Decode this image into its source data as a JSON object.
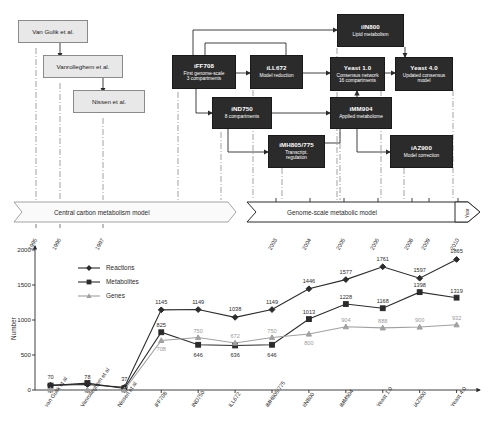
{
  "diagram": {
    "light_boxes": [
      {
        "id": "van-gulik",
        "label": "Van Gulik et al."
      },
      {
        "id": "vanrolleghem",
        "label": "Vanrolleghem et al."
      },
      {
        "id": "nissen",
        "label": "Nissen et al."
      }
    ],
    "dark_boxes": [
      {
        "id": "iff708",
        "title": "iFF708",
        "subtitle": "First genome-scale\n3 compartments"
      },
      {
        "id": "ill672",
        "title": "iLL672",
        "subtitle": "Model reduction"
      },
      {
        "id": "iin800",
        "title": "iIN800",
        "subtitle": "Lipid metabolism"
      },
      {
        "id": "yeast1",
        "title": "Yeast 1.0",
        "subtitle": "Consensus network\n16 compartments"
      },
      {
        "id": "yeast4",
        "title": "Yeast 4.0",
        "subtitle": "Updated consensus\nmodel"
      },
      {
        "id": "ind750",
        "title": "iND750",
        "subtitle": "8 compartments"
      },
      {
        "id": "imm904",
        "title": "iMM904",
        "subtitle": "Applied metabolome"
      },
      {
        "id": "imh805",
        "title": "iMH805/775",
        "subtitle": "Transcript.\nregulation"
      },
      {
        "id": "iaz900",
        "title": "iAZ900",
        "subtitle": "Model correction"
      }
    ]
  },
  "timeline": {
    "banner_left": "Central carbon metabolism model",
    "banner_right": "Genome-scale metabolic model",
    "axis_label": "Year",
    "years_left": [
      "1995",
      "1996",
      "1997"
    ],
    "years_right": [
      "2003",
      "2004",
      "2005",
      "2006",
      "2008",
      "2009",
      "2010"
    ]
  },
  "chart_data": {
    "type": "line",
    "title": "",
    "xlabel": "",
    "ylabel": "Number",
    "ylim": [
      0,
      2000
    ],
    "yticks": [
      0,
      500,
      1000,
      1500,
      2000
    ],
    "grid": false,
    "legend_position": "upper-left-inside",
    "categories": [
      "van Gulik et al",
      "Vanrolleghem et al",
      "Nissen et al",
      "iFF708",
      "iND750",
      "iLL672",
      "iMH805/775",
      "iIN800",
      "iMM904",
      "Yeast 1.0",
      "iAZ900",
      "Yeast 4.0"
    ],
    "series": [
      {
        "name": "Reactions",
        "marker": "diamond",
        "color": "#2b2b2b",
        "values": [
          70,
          78,
          37,
          1145,
          1149,
          1038,
          1149,
          1446,
          1577,
          1761,
          1597,
          1865
        ],
        "labels": [
          "70",
          "78",
          "37",
          "1145",
          "1149",
          "1038",
          "1149",
          "1446",
          "1577",
          "1761",
          "1597",
          "1865"
        ]
      },
      {
        "name": "Metabolites",
        "marker": "square",
        "color": "#2b2b2b",
        "values": [
          63,
          98,
          22,
          825,
          646,
          636,
          646,
          1013,
          1228,
          1168,
          1398,
          1319
        ],
        "labels": [
          "63",
          "98",
          "22",
          "825",
          "646",
          "636",
          "646",
          "1013",
          "1228",
          "1168",
          "1398",
          "1319"
        ]
      },
      {
        "name": "Genes",
        "marker": "triangle",
        "color": "#a0a0a0",
        "values": [
          0,
          0,
          0,
          708,
          750,
          672,
          750,
          800,
          904,
          888,
          900,
          932
        ],
        "labels": [
          "0",
          "0",
          "0",
          "708",
          "750",
          "672",
          "750",
          "800",
          "904",
          "888",
          "900",
          "932"
        ]
      }
    ]
  }
}
